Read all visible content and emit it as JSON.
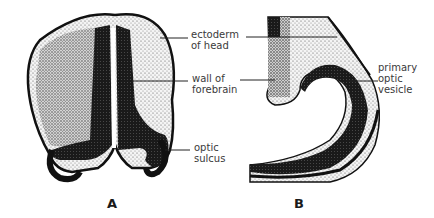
{
  "figure": {
    "panels": [
      {
        "id": "A",
        "letter": "A",
        "description": "transverse section of embryonic head showing forebrain",
        "labels": [
          {
            "key": "ectoderm",
            "text": "ectoderm\nof head"
          },
          {
            "key": "wall",
            "text": "wall of\nforebrain"
          },
          {
            "key": "sulcus",
            "text": "optic\nsulcus"
          }
        ]
      },
      {
        "id": "B",
        "letter": "B",
        "description": "enlarged section showing primary optic vesicle",
        "labels": [
          {
            "key": "vesicle",
            "text": "primary\noptic\nvesicle"
          }
        ]
      }
    ],
    "colors": {
      "ink": "#111111",
      "stipple_light": "#bdbdbd",
      "background": "#ffffff",
      "label_text": "#3a3a3a"
    }
  }
}
